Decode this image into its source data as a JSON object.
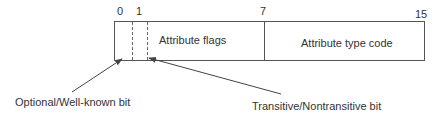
{
  "diagram": {
    "bit_positions": [
      {
        "label": "0"
      },
      {
        "label": "1"
      },
      {
        "label": "7"
      },
      {
        "label": "15"
      }
    ],
    "fields": [
      {
        "label": ""
      },
      {
        "label": ""
      },
      {
        "label": "Attribute flags"
      },
      {
        "label": "Attribute type code"
      }
    ],
    "callouts": [
      {
        "label": "Optional/Well-known bit",
        "points_to": "bit 0"
      },
      {
        "label": "Transitive/Nontransitive bit",
        "points_to": "bit 1"
      }
    ],
    "colors": {
      "line": "#555555",
      "text": "#333333",
      "background": "#ffffff"
    }
  }
}
